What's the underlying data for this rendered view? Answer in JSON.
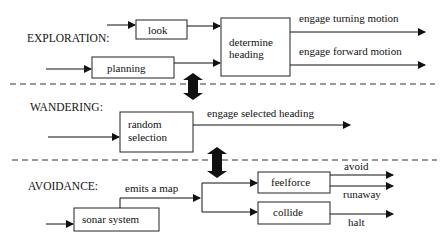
{
  "sections": {
    "exploration": {
      "label": "EXPLORATION:",
      "boxes": {
        "look": "look",
        "planning": "planning",
        "determine_heading_line1": "determine",
        "determine_heading_line2": "heading"
      },
      "outputs": [
        "engage turning motion",
        "engage forward motion"
      ]
    },
    "wandering": {
      "label": "WANDERING:",
      "boxes": {
        "random_selection_line1": "random",
        "random_selection_line2": "selection"
      },
      "outputs": [
        "engage selected heading"
      ]
    },
    "avoidance": {
      "label": "AVOIDANCE:",
      "boxes": {
        "sonar_system": "sonar system",
        "feelforce": "feelforce",
        "collide": "collide"
      },
      "connector_label": "emits a map",
      "outputs": [
        "avoid",
        "runaway",
        "halt"
      ]
    }
  },
  "colors": {
    "line": "#111111",
    "background": "#ffffff"
  }
}
